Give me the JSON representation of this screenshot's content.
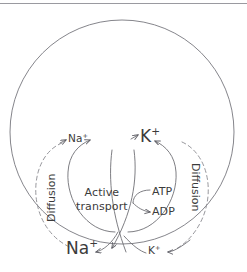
{
  "figure": {
    "stroke_color": "#6f6f75",
    "dashed_color": "#8a8a90",
    "text_color": "#3b3b3b",
    "rule_color": "#9a9aa0",
    "cell": {
      "shape": "circle",
      "cx": 122,
      "cy": 132,
      "r": 112
    }
  },
  "labels": {
    "na_top": {
      "ion": "Na",
      "charge": "+"
    },
    "k_top": {
      "ion": "K",
      "charge": "+"
    },
    "na_bottom": {
      "ion": "Na",
      "charge": "+"
    },
    "k_bottom": {
      "ion": "K",
      "charge": "+"
    },
    "atp": "ATP",
    "adp": "ADP",
    "active_transport_line1": "Active",
    "active_transport_line2": "transport",
    "diffusion_left": "Diffusion",
    "diffusion_right": "Diffusion"
  },
  "arrows": [
    {
      "name": "na-out-active-transport",
      "style": "solid",
      "from": "inside-cell",
      "to": "na-top"
    },
    {
      "name": "k-in-active-transport",
      "style": "solid",
      "from": "outside-cell",
      "to": "k-top"
    },
    {
      "name": "na-in-diffusion",
      "style": "dashed",
      "from": "na-top",
      "to": "na-bottom"
    },
    {
      "name": "k-out-diffusion",
      "style": "dashed",
      "from": "k-top",
      "to": "k-bottom"
    },
    {
      "name": "na-down-active",
      "style": "solid",
      "from": "center",
      "to": "na-bottom"
    },
    {
      "name": "k-down-active",
      "style": "solid",
      "from": "center",
      "to": "k-bottom"
    },
    {
      "name": "atp-to-adp",
      "style": "solid",
      "from": "atp",
      "to": "adp"
    }
  ]
}
